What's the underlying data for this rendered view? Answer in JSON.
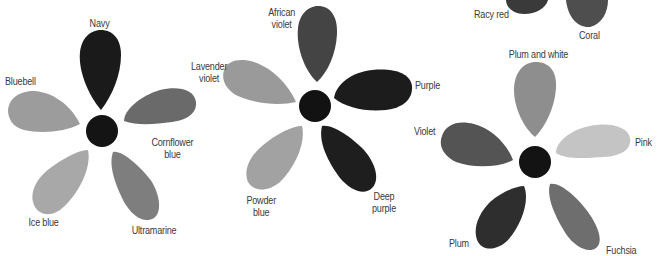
{
  "flowers": [
    {
      "id": "blue-flower",
      "center_color": "#141414",
      "petals": [
        {
          "label": "Navy",
          "color": "#1a1a1a"
        },
        {
          "label": "Bluebell",
          "color": "#9c9c9c"
        },
        {
          "label": "Cornflower blue",
          "label_lines": [
            "Cornflower",
            "blue"
          ],
          "color": "#6a6a6a"
        },
        {
          "label": "Ice blue",
          "color": "#a8a8a8"
        },
        {
          "label": "Ultramarine",
          "color": "#7e7e7e"
        }
      ]
    },
    {
      "id": "purple-flower",
      "center_color": "#121212",
      "petals": [
        {
          "label": "African violet",
          "label_lines": [
            "African",
            "violet"
          ],
          "color": "#444444"
        },
        {
          "label": "Lavender violet",
          "label_lines": [
            "Lavender",
            "violet"
          ],
          "color": "#9a9a9a"
        },
        {
          "label": "Purple",
          "color": "#1c1c1c"
        },
        {
          "label": "Powder blue",
          "label_lines": [
            "Powder",
            "blue"
          ],
          "color": "#a2a2a2"
        },
        {
          "label": "Deep purple",
          "label_lines": [
            "Deep",
            "purple"
          ],
          "color": "#1e1e1e"
        }
      ]
    },
    {
      "id": "pink-flower",
      "center_color": "#131313",
      "petals": [
        {
          "label": "Plum and white",
          "color": "#8e8e8e"
        },
        {
          "label": "Violet",
          "color": "#545454"
        },
        {
          "label": "Pink",
          "color": "#c4c4c4"
        },
        {
          "label": "Plum",
          "color": "#2e2e2e"
        },
        {
          "label": "Fuchsia",
          "color": "#6e6e6e"
        }
      ]
    },
    {
      "id": "red-flower-partial",
      "petals": [
        {
          "label": "Racy red",
          "color": "#3a3a3a"
        },
        {
          "label": "Coral",
          "color": "#4e4e4e"
        }
      ]
    }
  ]
}
